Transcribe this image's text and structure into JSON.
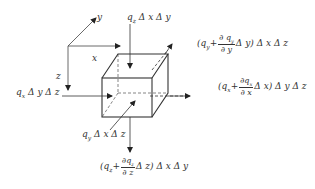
{
  "diagram": {
    "axes": {
      "x": "x",
      "y": "y",
      "z": "z"
    },
    "labels": {
      "qz_in": "q_z Δ x Δ y",
      "qx_in": "q_x Δ y Δ z",
      "qy_in": "q_y Δ x Δ z"
    },
    "qz_in": {
      "pre": "q",
      "sub": "z",
      "post": " Δ x Δ y"
    },
    "qx_in": {
      "pre": "q",
      "sub": "x",
      "post": " Δ y Δ z"
    },
    "qy_in": {
      "pre": "q",
      "sub": "y",
      "post": " Δ x Δ z"
    },
    "qy_out": {
      "open": "(q",
      "sub": "y",
      "plus": "+",
      "num": "∂ q",
      "num_sub": "y",
      "den": "∂ y",
      "after": "Δ y) Δ x Δ z"
    },
    "qx_out": {
      "open": "(q",
      "sub": "x",
      "plus": "+",
      "num": "∂q",
      "num_sub": "x",
      "den": "∂ x",
      "after": "Δ x) Δ y Δ z"
    },
    "qz_out": {
      "open": "(q",
      "sub": "z",
      "plus": "+",
      "num": "∂q",
      "num_sub": "z",
      "den": "∂ z",
      "after": "Δ z) Δ x Δ y"
    }
  }
}
